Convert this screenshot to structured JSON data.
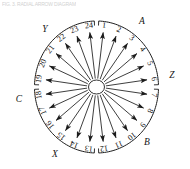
{
  "figure": {
    "caption_strip": "FIG. 3.  RADIAL ARROW DIAGRAM",
    "title": "",
    "spoke_count": 24,
    "hub_label": ""
  },
  "chart_data": {
    "type": "scatter",
    "title": "",
    "subtitle": "",
    "xlabel": "",
    "ylabel": "",
    "grid": false,
    "legend_position": "none",
    "center": {
      "x": 96.5,
      "y": 87.0
    },
    "inner_radius": {
      "rx": 8.0,
      "ry": 7.0
    },
    "outer_radius": {
      "rx": 54.0,
      "ry": 58.0
    },
    "arc_radius": {
      "rx": 62.0,
      "ry": 66.0
    },
    "spokes": [
      {
        "label": "1",
        "angle_deg": 82.5
      },
      {
        "label": "2",
        "angle_deg": 67.5
      },
      {
        "label": "3",
        "angle_deg": 52.5
      },
      {
        "label": "4",
        "angle_deg": 37.5
      },
      {
        "label": "5",
        "angle_deg": 22.5
      },
      {
        "label": "6",
        "angle_deg": 7.5
      },
      {
        "label": "7",
        "angle_deg": -7.5
      },
      {
        "label": "8",
        "angle_deg": -22.5
      },
      {
        "label": "9",
        "angle_deg": -37.5
      },
      {
        "label": "10",
        "angle_deg": -52.5
      },
      {
        "label": "11",
        "angle_deg": -67.5
      },
      {
        "label": "12",
        "angle_deg": -82.5
      },
      {
        "label": "13",
        "angle_deg": -97.5
      },
      {
        "label": "14",
        "angle_deg": -112.5
      },
      {
        "label": "15",
        "angle_deg": -127.5
      },
      {
        "label": "16",
        "angle_deg": -142.5
      },
      {
        "label": "17",
        "angle_deg": -157.5
      },
      {
        "label": "18",
        "angle_deg": -172.5
      },
      {
        "label": "19",
        "angle_deg": 172.5
      },
      {
        "label": "20",
        "angle_deg": 157.5
      },
      {
        "label": "21",
        "angle_deg": 142.5
      },
      {
        "label": "22",
        "angle_deg": 127.5
      },
      {
        "label": "23",
        "angle_deg": 112.5
      },
      {
        "label": "24",
        "angle_deg": 97.5
      }
    ],
    "arc_segments": [
      {
        "name": "segment-A",
        "start_deg": 88.0,
        "end_deg": 2.0,
        "letter": "A"
      },
      {
        "name": "segment-B",
        "start_deg": -2.0,
        "end_deg": -88.0,
        "letter": "B"
      },
      {
        "name": "segment-C",
        "start_deg": -92.0,
        "end_deg": -178.0,
        "letter": "C"
      },
      {
        "name": "segment-D",
        "start_deg": 178.0,
        "end_deg": 92.0,
        "letter": "D"
      }
    ],
    "zone_letters": [
      {
        "label": "A",
        "position": "top-right",
        "x": 142,
        "y": 22
      },
      {
        "label": "Z",
        "position": "right",
        "x": 172,
        "y": 76
      },
      {
        "label": "B",
        "position": "bottom-right",
        "x": 147,
        "y": 143
      },
      {
        "label": "X",
        "position": "bottom-left",
        "x": 55,
        "y": 155
      },
      {
        "label": "C",
        "position": "left",
        "x": 19,
        "y": 100
      },
      {
        "label": "Y",
        "position": "top-left",
        "x": 45,
        "y": 30
      }
    ]
  }
}
